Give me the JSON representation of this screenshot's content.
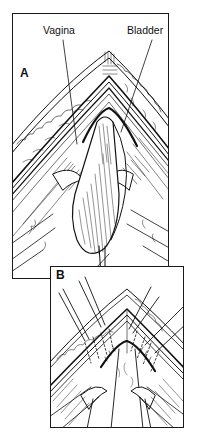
{
  "figure": {
    "panels": [
      {
        "id": "A",
        "letter": "A",
        "labels": [
          {
            "text": "Vagina"
          },
          {
            "text": "Bladder"
          }
        ]
      },
      {
        "id": "B",
        "letter": "B"
      }
    ],
    "colors": {
      "ink": "#111111",
      "background": "#ffffff"
    }
  }
}
